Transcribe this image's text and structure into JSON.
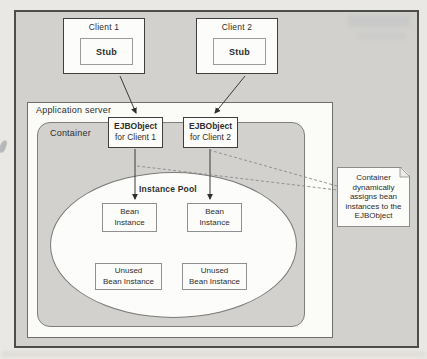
{
  "colors": {
    "page_bg": "#eae8e4",
    "panel_grey": "#d2d1ce",
    "box_white": "#fcfcfa",
    "text": "#2e2e2e"
  },
  "diagram": {
    "client1": {
      "title": "Client 1",
      "stub": "Stub"
    },
    "client2": {
      "title": "Client 2",
      "stub": "Stub"
    },
    "app_server": {
      "label": "Application server"
    },
    "container": {
      "label": "Container"
    },
    "ejb1": {
      "name": "EJBObject",
      "sub": "for Client 1"
    },
    "ejb2": {
      "name": "EJBObject",
      "sub": "for Client 2"
    },
    "pool": {
      "title": "Instance Pool",
      "bean1": "Bean\nInstance",
      "bean2": "Bean\nInstance",
      "unused1": "Unused\nBean Instance",
      "unused2": "Unused\nBean Instance"
    },
    "note": {
      "text": "Container\ndynamically\nassigns bean\ninstances to the\nEJBObject"
    }
  }
}
